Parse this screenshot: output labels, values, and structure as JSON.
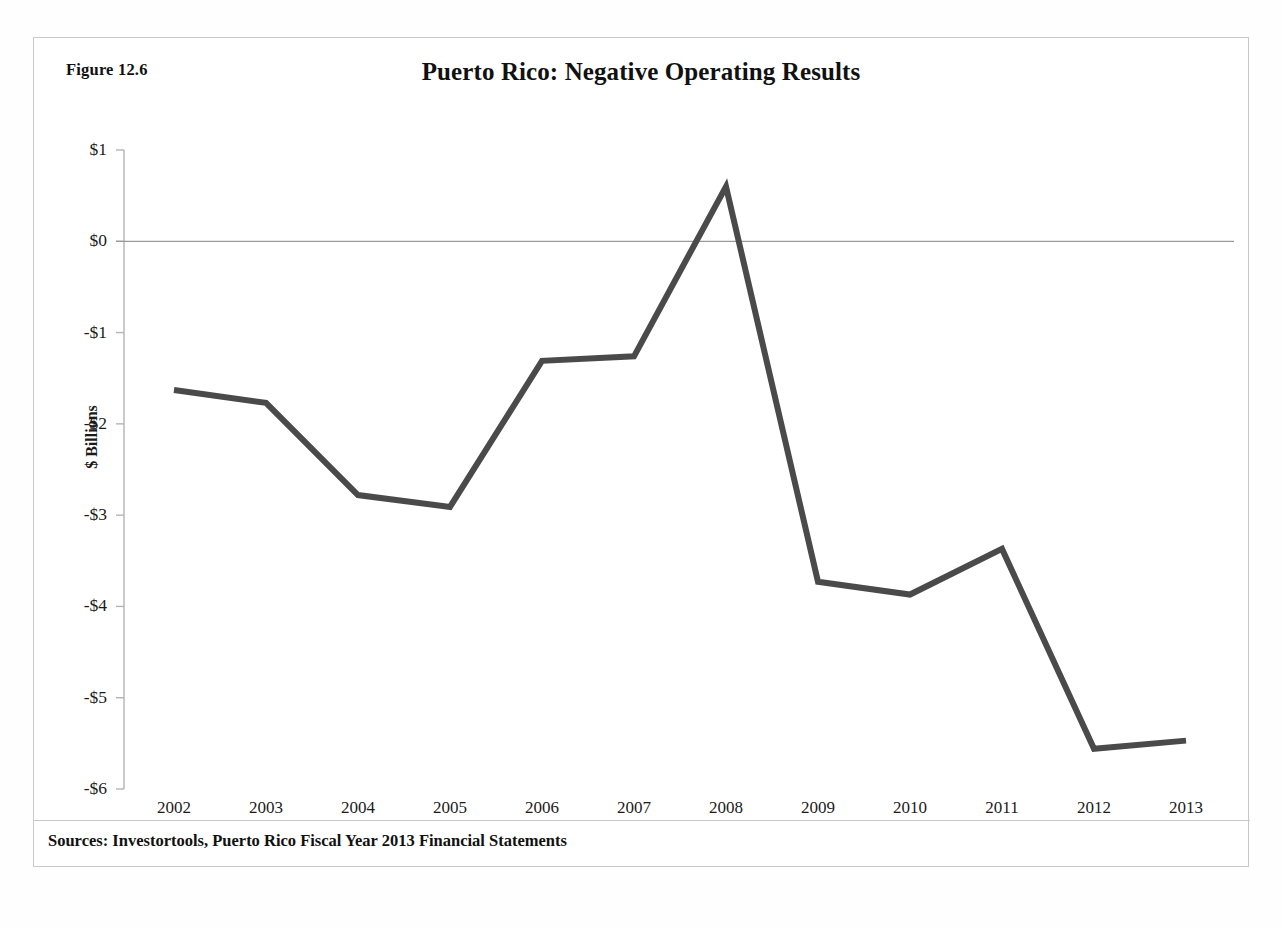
{
  "figure": {
    "label": "Figure 12.6",
    "source_note": "Sources: Investortools, Puerto Rico Fiscal Year 2013 Financial Statements"
  },
  "chart_data": {
    "type": "line",
    "title": "Puerto Rico: Negative Operating Results",
    "xlabel": "",
    "ylabel": "$ Billions",
    "categories": [
      "2002",
      "2003",
      "2004",
      "2005",
      "2006",
      "2007",
      "2008",
      "2009",
      "2010",
      "2011",
      "2012",
      "2013"
    ],
    "values": [
      -1.63,
      -1.77,
      -2.78,
      -2.91,
      -1.31,
      -1.26,
      0.6,
      -3.73,
      -3.87,
      -3.37,
      -5.56,
      -5.47
    ],
    "series": [
      {
        "name": "Operating Results",
        "values": [
          -1.63,
          -1.77,
          -2.78,
          -2.91,
          -1.31,
          -1.26,
          0.6,
          -3.73,
          -3.87,
          -3.37,
          -5.56,
          -5.47
        ]
      }
    ],
    "ylim": [
      -6,
      1
    ],
    "ytick_values": [
      1,
      0,
      -1,
      -2,
      -3,
      -4,
      -5,
      -6
    ],
    "ytick_labels": [
      "$1",
      "$0",
      "-$1",
      "-$2",
      "-$3",
      "-$4",
      "-$5",
      "-$6"
    ],
    "grid": false,
    "zero_line": true,
    "legend": "none",
    "line_color": "#4a4a4a",
    "axis_color": "#b4b4b4",
    "zero_line_color": "#9a9a9a",
    "line_width": 6
  }
}
